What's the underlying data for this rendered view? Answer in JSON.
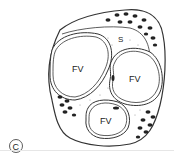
{
  "figure": {
    "panel_label": "C",
    "labels": {
      "vesicle_top_left": "FV",
      "vesicle_right": "FV",
      "vesicle_bottom": "FV",
      "space": "S"
    },
    "colors": {
      "stroke": "#333333",
      "fill": "#ffffff",
      "dots": "#222222",
      "stipple": "#888888"
    }
  }
}
